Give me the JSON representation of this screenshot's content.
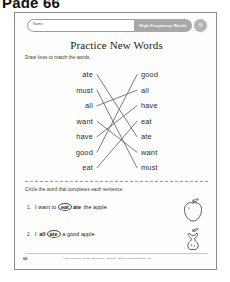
{
  "page_caption": "Page 66",
  "header": {
    "name_label": "Name",
    "strand_label": "High-Frequency Words",
    "lesson_number": "9"
  },
  "worksheet": {
    "title": "Practice New Words",
    "instruction_match": "Draw lines to match the words.",
    "instruction_circle": "Circle the word that completes each sentence."
  },
  "matching": {
    "left_words": [
      "ate",
      "must",
      "all",
      "want",
      "have",
      "good",
      "eat"
    ],
    "right_words": [
      "good",
      "all",
      "have",
      "eat",
      "ate",
      "want",
      "must"
    ],
    "connections": [
      {
        "left": 0,
        "right": 4
      },
      {
        "left": 1,
        "right": 6
      },
      {
        "left": 2,
        "right": 1
      },
      {
        "left": 3,
        "right": 5
      },
      {
        "left": 4,
        "right": 2
      },
      {
        "left": 5,
        "right": 0
      },
      {
        "left": 6,
        "right": 3
      }
    ]
  },
  "sentences": [
    {
      "number": "1.",
      "before": "I want to",
      "choice_circled": "eat",
      "choice_plain": "ate",
      "after": "the apple.",
      "illustration": "whole-apple"
    },
    {
      "number": "2.",
      "before": "I",
      "choice_plain": "all",
      "choice_circled": "ate",
      "after": "a good apple.",
      "illustration": "apple-core"
    }
  ],
  "footer": {
    "page_number": "66",
    "credit": "High-Frequency Words: Stories and Activities  © ECS Learning Systems, Inc."
  },
  "colors": {
    "badge_gray": "#a8a8a8",
    "circle_gray": "#b4b4b4",
    "ink": "#2c2c2c",
    "line": "#5a5a5a"
  }
}
